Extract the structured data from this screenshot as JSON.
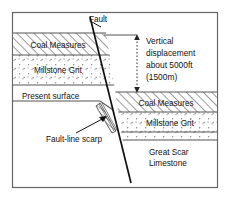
{
  "figure": {
    "frame_color": "#555555",
    "background": "#ffffff"
  },
  "labels": {
    "fault": "Fault",
    "present_surface": "Present surface",
    "fault_line_scarp": "Fault-line scarp",
    "coal_measures_left": "Coal Measures",
    "millstone_grit_left": "Millstone Grit",
    "coal_measures_right": "Coal Measures",
    "millstone_grit_right": "Millstone Grit",
    "great_scar_limestone_line1": "Great Scar",
    "great_scar_limestone_line2": "Limestone"
  },
  "annotation": {
    "line1": "Vertical",
    "line2": "displacement",
    "line3": "about 5000ft",
    "line4": "(1500m)"
  },
  "strata": {
    "left_block": [
      {
        "name": "Coal Measures",
        "pattern": "diagonal-hatch",
        "top": 33,
        "bottom": 55
      },
      {
        "name": "Millstone Grit",
        "pattern": "stipple-dots",
        "top": 55,
        "bottom": 85
      }
    ],
    "right_block": [
      {
        "name": "Coal Measures",
        "pattern": "diagonal-hatch",
        "top": 92,
        "bottom": 112
      },
      {
        "name": "Millstone Grit",
        "pattern": "stipple-dots",
        "top": 112,
        "bottom": 132
      },
      {
        "name": "Great Scar Limestone",
        "pattern": "blank",
        "top": 140,
        "bottom": 188
      }
    ],
    "stipple_band_right": {
      "top": 132,
      "bottom": 140
    }
  },
  "measurements": {
    "displacement_feet": "5000ft",
    "displacement_metres": "1500m"
  },
  "colors": {
    "line": "#111111",
    "hatch": "#444444",
    "stipple": "#777777",
    "dashed_arrow": "#333333"
  }
}
